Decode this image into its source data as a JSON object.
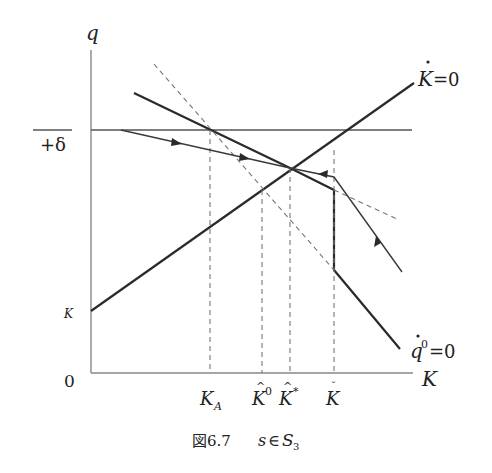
{
  "figure": {
    "caption_prefix": "図6.7",
    "caption_s": "s",
    "caption_in": "∈",
    "caption_S": "S",
    "caption_sub": "3"
  },
  "axes": {
    "y_label": "q",
    "x_label": "K",
    "origin_label": "0",
    "y_tick_upper_label": "+δ",
    "y_tick_lower_label": "K"
  },
  "curves": {
    "k_dot_zero": {
      "symbol": "K",
      "dot": "·",
      "eq": "=0"
    },
    "q_dot_zero": {
      "symbol": "q",
      "sup": "0",
      "eq": "=0"
    }
  },
  "x_ticks": {
    "k_a": {
      "base": "K",
      "sub": "A"
    },
    "k_hat_0": {
      "base": "K",
      "accent": "^",
      "sup": "0"
    },
    "k_hat_star": {
      "base": "K",
      "accent": "^",
      "sup": "*"
    },
    "k_breve": {
      "base": "K",
      "accent": "˘"
    }
  }
}
